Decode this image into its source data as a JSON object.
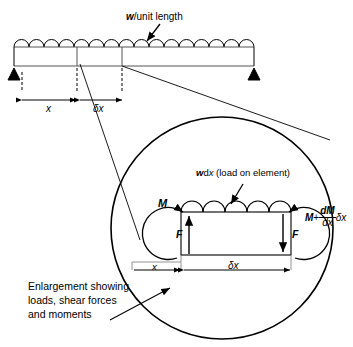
{
  "figure": {
    "title_text": "Enlargement showing loads, shear forces and moments",
    "stroke_color": "#000000",
    "fill_color": "#ffffff",
    "background": "#ffffff"
  },
  "top_beam": {
    "load_label": "w/unit length",
    "dimension_x": "x",
    "dimension_dx": "δx",
    "arc_count": 16,
    "support_left": "pin-support",
    "support_right": "pin-support"
  },
  "enlargement": {
    "caption_line1": "Enlargement showing",
    "caption_line2": "loads, shear forces",
    "caption_line3": "and moments",
    "element_load_label": "wdx (load on element)",
    "moment_left": "M",
    "shear_left": "F",
    "shear_right": "F",
    "moment_right_base": "M",
    "moment_right_plus": "+",
    "moment_right_num": "dM",
    "moment_right_den": "dx",
    "moment_right_tail": "δx",
    "dimension_x": "x",
    "dimension_dx": "δx",
    "arc_count": 5
  }
}
